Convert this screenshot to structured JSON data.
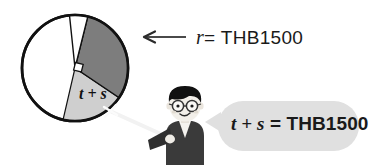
{
  "figure": {
    "circle": {
      "center_x": 75,
      "center_y": 68,
      "radius": 53,
      "outline_color": "#111111",
      "fill_color": "#ffffff"
    },
    "sectors": [
      {
        "name": "narrow-top-sector",
        "start_deg": 76,
        "end_deg": 96,
        "fill": "#ffffff",
        "stroke": "#111111"
      },
      {
        "name": "dark-sector",
        "label": "t + s",
        "start_deg": -34,
        "end_deg": 76,
        "fill": "#7d7d7d",
        "stroke": "#111111"
      },
      {
        "name": "light-sector",
        "start_deg": -103,
        "end_deg": -34,
        "fill": "#cfcfcf",
        "stroke": "#111111"
      }
    ],
    "right_angle_marker": {
      "name": "right-angle-marker",
      "present": true
    },
    "sector_label": "t + s"
  },
  "radius_callout": {
    "arrow_name": "radius-arrow",
    "variable": "r",
    "equals": "=",
    "value": "THB1500",
    "full_text": "r = THB1500"
  },
  "character": {
    "name": "student-boy",
    "hair_color": "#111111",
    "skin_color": "#f2efe9",
    "jacket_color": "#3a3a3a",
    "glasses": true,
    "pointer": "white-pointer-stick"
  },
  "speech_bubble": {
    "fill": "#e0e0e0",
    "expression_left": "t + s",
    "equals": "=",
    "value": "THB1500",
    "full_text": "t + s = THB1500"
  }
}
